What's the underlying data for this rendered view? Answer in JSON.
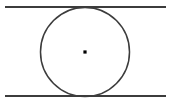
{
  "figure": {
    "type": "geometry-diagram",
    "canvas": {
      "width": 172,
      "height": 107,
      "background_color": "#ffffff"
    },
    "shapes": {
      "top_line": {
        "name": "top parallel line",
        "x1": 5,
        "y1": 7,
        "x2": 166,
        "y2": 7,
        "stroke_color": "#3c3c3c",
        "stroke_width": 2
      },
      "bottom_line": {
        "name": "bottom parallel line",
        "x1": 5,
        "y1": 96,
        "x2": 166,
        "y2": 96,
        "stroke_color": "#3c3c3c",
        "stroke_width": 2
      },
      "circle": {
        "name": "inscribed circle",
        "cx": 85,
        "cy": 52,
        "r": 44.5,
        "stroke_color": "#3c3c3c",
        "stroke_width": 1.5,
        "fill": "none"
      },
      "center_dot": {
        "name": "circle center point",
        "cx": 85,
        "cy": 52,
        "size": 3.2,
        "fill": "#000000"
      }
    }
  }
}
